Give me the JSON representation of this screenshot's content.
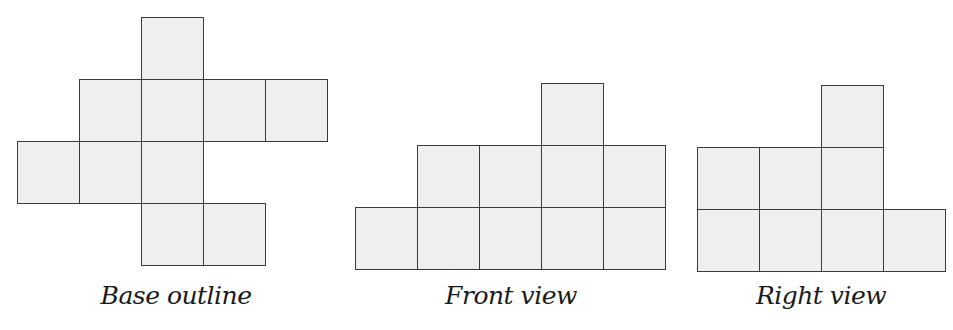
{
  "cell_size": 62,
  "views": [
    {
      "id": "base-outline",
      "label": "Base outline",
      "origin": [
        17,
        17
      ],
      "caption_pos": [
        176,
        303
      ],
      "cells": [
        [
          2,
          0
        ],
        [
          1,
          1
        ],
        [
          2,
          1
        ],
        [
          3,
          1
        ],
        [
          4,
          1
        ],
        [
          0,
          2
        ],
        [
          1,
          2
        ],
        [
          2,
          2
        ],
        [
          2,
          3
        ],
        [
          3,
          3
        ]
      ]
    },
    {
      "id": "front-view",
      "label": "Front view",
      "origin": [
        355,
        83
      ],
      "caption_pos": [
        511,
        303
      ],
      "cells": [
        [
          3,
          0
        ],
        [
          1,
          1
        ],
        [
          2,
          1
        ],
        [
          3,
          1
        ],
        [
          4,
          1
        ],
        [
          0,
          2
        ],
        [
          1,
          2
        ],
        [
          2,
          2
        ],
        [
          3,
          2
        ],
        [
          4,
          2
        ]
      ]
    },
    {
      "id": "right-view",
      "label": "Right view",
      "origin": [
        697,
        85
      ],
      "caption_pos": [
        821,
        303
      ],
      "cells": [
        [
          2,
          0
        ],
        [
          0,
          1
        ],
        [
          1,
          1
        ],
        [
          2,
          1
        ],
        [
          0,
          2
        ],
        [
          1,
          2
        ],
        [
          2,
          2
        ],
        [
          3,
          2
        ]
      ]
    }
  ]
}
